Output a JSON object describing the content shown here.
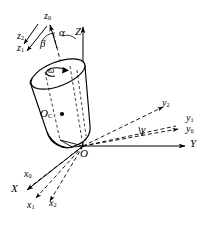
{
  "figure": {
    "type": "engineering-diagram",
    "background_color": "#ffffff",
    "stroke_color": "#000000"
  },
  "labels": {
    "Z": "Z",
    "Y": "Y",
    "X": "X",
    "z0": "z",
    "z0_sub": "0",
    "z1": "z",
    "z1_sub": "1",
    "z2": "z",
    "z2_sub": "2",
    "y0": "y",
    "y0_sub": "0",
    "y1": "y",
    "y1_sub": "1",
    "y2": "y",
    "y2_sub": "2",
    "x0": "x",
    "x0_sub": "0",
    "x1": "x",
    "x1_sub": "1",
    "x2": "x",
    "x2_sub": "2",
    "alpha": "α",
    "beta": "β",
    "gamma": "γ",
    "omega": "ω",
    "origin": "O",
    "body_center": "O",
    "body_center_sub": "C"
  },
  "axes": {
    "fixed_frame": [
      "X",
      "Y",
      "Z"
    ],
    "intermediate_frames": [
      [
        "x0",
        "y0",
        "z0"
      ],
      [
        "x1",
        "y1",
        "z1"
      ],
      [
        "x2",
        "y2",
        "z2"
      ]
    ],
    "fixed_style": "solid",
    "rotated_style": "dashed"
  },
  "angles": [
    {
      "name": "α",
      "between": [
        "Z",
        "z0"
      ]
    },
    {
      "name": "β",
      "between": [
        "z0",
        "z1"
      ]
    },
    {
      "name": "γ",
      "between": [
        "y0",
        "y2"
      ]
    }
  ],
  "body": {
    "shape": "cylinder",
    "center_label": "OC",
    "angular_velocity_label": "ω",
    "fill": "#ffffff",
    "outline": "#000000"
  }
}
